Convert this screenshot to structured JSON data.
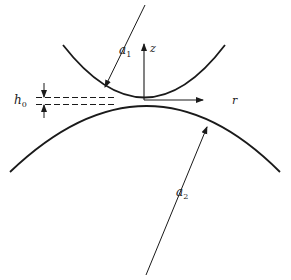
{
  "diagram": {
    "type": "contact-geometry",
    "labels": {
      "a1": "a",
      "a1_sub": "1",
      "a2": "a",
      "a2_sub": "2",
      "h0": "h",
      "h0_sub": "0",
      "z_axis": "z",
      "r_axis": "r"
    },
    "colors": {
      "stroke": "#1a1a1a",
      "background": "#ffffff"
    }
  }
}
